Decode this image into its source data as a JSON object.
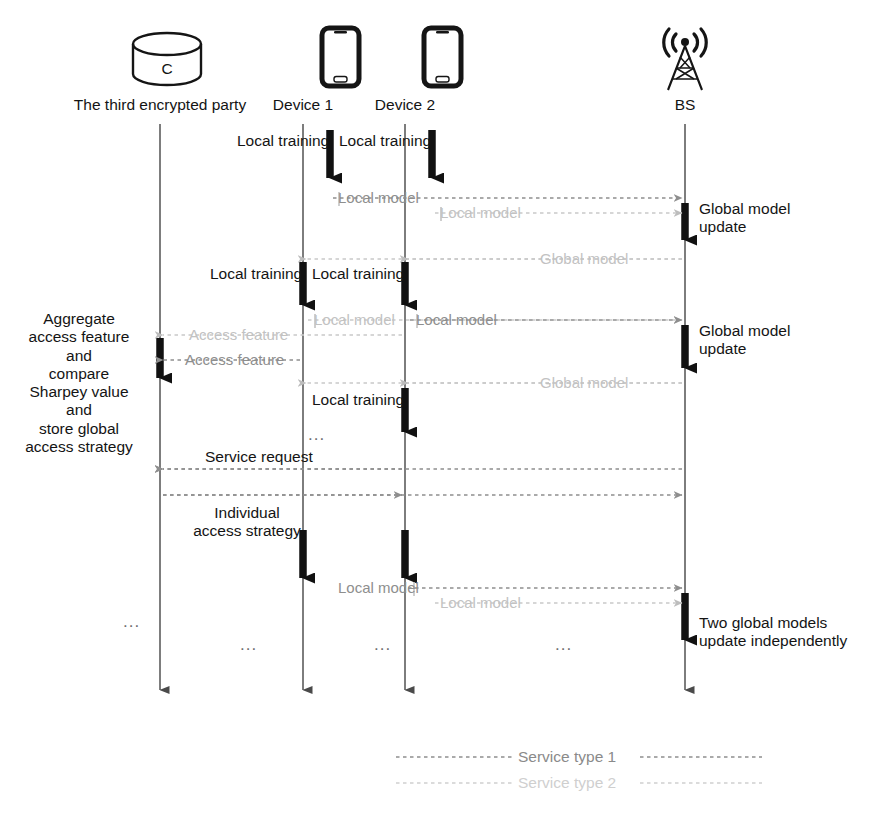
{
  "diagram": {
    "colors": {
      "lifeline": "#6f6f6f",
      "activation": "#111111",
      "service_type_1": "#8e8e8e",
      "service_type_2": "#c9c9c9",
      "text": "#141414"
    }
  },
  "actors": [
    {
      "id": "tep",
      "label": "The third encrypted party",
      "icon": "database-cylinder-icon",
      "icon_text": "C",
      "x": 160
    },
    {
      "id": "dev1",
      "label": "Device 1",
      "icon": "smartphone-icon",
      "x": 303
    },
    {
      "id": "dev2",
      "label": "Device 2",
      "icon": "smartphone-icon",
      "x": 405
    },
    {
      "id": "bs",
      "label": "BS",
      "icon": "cell-tower-icon",
      "x": 685
    }
  ],
  "activation_labels": {
    "local_training": "Local training",
    "global_model_update": "Global model\nupdate",
    "two_global_models": "Two global models\nupdate independently"
  },
  "side_note": {
    "lines": [
      "Aggregate",
      "access feature",
      "and",
      "compare",
      "Sharpey value",
      "and",
      "store global",
      "access strategy"
    ]
  },
  "messages": [
    {
      "id": "m1",
      "label": "Local model",
      "type": "service_type_1",
      "from": "dev1",
      "to": "bs",
      "direction": "right",
      "y": 198
    },
    {
      "id": "m2",
      "label": "Local model",
      "type": "service_type_2",
      "from": "dev2",
      "to": "bs",
      "direction": "right",
      "y": 213
    },
    {
      "id": "m3",
      "label": "Global model",
      "type": "service_type_2",
      "from": "bs",
      "to": "dev1",
      "direction": "left",
      "y": 259
    },
    {
      "id": "m4",
      "label": "Access feature",
      "type": "service_type_2",
      "from": "dev2",
      "to": "tep",
      "direction": "left",
      "y": 335
    },
    {
      "id": "m5",
      "label": "Local model",
      "type": "service_type_2",
      "from": "dev1",
      "to": "bs",
      "direction": "right",
      "y": 320
    },
    {
      "id": "m6",
      "label": "Local model",
      "type": "service_type_1",
      "from": "dev2",
      "to": "bs",
      "direction": "right",
      "y": 320
    },
    {
      "id": "m7",
      "label": "Access feature",
      "type": "service_type_1",
      "from": "dev1",
      "to": "tep",
      "direction": "left",
      "y": 360
    },
    {
      "id": "m8",
      "label": "Global model",
      "type": "service_type_2",
      "from": "bs",
      "to": "dev1",
      "direction": "left",
      "y": 383
    },
    {
      "id": "m9",
      "label": "Service request",
      "type": "service_type_1",
      "from": "dev2",
      "to": "tep",
      "direction": "left",
      "y": 469
    },
    {
      "id": "m10",
      "label": "Individual access strategy",
      "type": "service_type_1",
      "from": "tep",
      "to": "dev2",
      "direction": "right",
      "y": 495
    },
    {
      "id": "m11",
      "label": "Local model",
      "type": "service_type_1",
      "from": "dev1",
      "to": "bs",
      "direction": "right",
      "y": 588
    },
    {
      "id": "m12",
      "label": "Local model",
      "type": "service_type_2",
      "from": "dev2",
      "to": "bs",
      "direction": "right",
      "y": 603
    }
  ],
  "ellipses": [
    {
      "x": 130,
      "y": 622
    },
    {
      "x": 247,
      "y": 645
    },
    {
      "x": 315,
      "y": 435
    },
    {
      "x": 381,
      "y": 645
    },
    {
      "x": 562,
      "y": 645
    }
  ],
  "legend": [
    {
      "label": "Service type 1",
      "type": "service_type_1"
    },
    {
      "label": "Service type 2",
      "type": "service_type_2"
    }
  ]
}
